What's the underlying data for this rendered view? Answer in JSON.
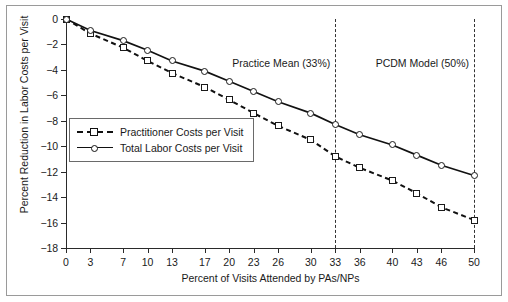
{
  "figure": {
    "background": "#ffffff",
    "frame_color": "#9a9a9a"
  },
  "chart_data": {
    "type": "line",
    "title": "",
    "xlabel": "Percent of Visits Attended by PAs/NPs",
    "ylabel": "Percent Reduction in Labor Costs per Visit",
    "xlim": [
      0,
      50
    ],
    "ylim": [
      -18,
      0
    ],
    "grid": false,
    "legend_position": "inside-left",
    "xticks": [
      0,
      3,
      7,
      10,
      13,
      17,
      20,
      23,
      26,
      30,
      33,
      36,
      40,
      43,
      46,
      50
    ],
    "xtick_labels": [
      "0",
      "3",
      "7",
      "10",
      "13",
      "17",
      "20",
      "23",
      "26",
      "30",
      "33",
      "36",
      "40",
      "43",
      "46",
      "50"
    ],
    "yticks": [
      0,
      -2,
      -4,
      -6,
      -8,
      -10,
      -12,
      -14,
      -16,
      -18
    ],
    "ytick_labels": [
      "0",
      "-2",
      "-4",
      "-6",
      "-8",
      "-10",
      "-12",
      "-14",
      "-16",
      "-18"
    ],
    "x": [
      0,
      3,
      7,
      10,
      13,
      17,
      20,
      23,
      26,
      30,
      33,
      36,
      40,
      43,
      46,
      50
    ],
    "series": [
      {
        "name": "Practitioner Costs per Visit",
        "style": "dashed",
        "marker": "square",
        "color": "#111111",
        "values": [
          0,
          -1.15,
          -2.25,
          -3.3,
          -4.25,
          -5.35,
          -6.35,
          -7.4,
          -8.4,
          -9.5,
          -10.8,
          -11.7,
          -12.7,
          -13.7,
          -14.8,
          -15.8
        ]
      },
      {
        "name": "Total Labor Costs per Visit",
        "style": "solid",
        "marker": "circle",
        "color": "#111111",
        "values": [
          0,
          -0.9,
          -1.7,
          -2.45,
          -3.3,
          -4.1,
          -4.9,
          -5.7,
          -6.5,
          -7.4,
          -8.3,
          -9.1,
          -9.9,
          -10.7,
          -11.5,
          -12.3
        ]
      }
    ],
    "annotations": [
      {
        "label": "Practice Mean (33%)",
        "x": 33,
        "line": "dashed"
      },
      {
        "label": "PCDM Model (50%)",
        "x": 50,
        "line": "dashed"
      }
    ]
  }
}
